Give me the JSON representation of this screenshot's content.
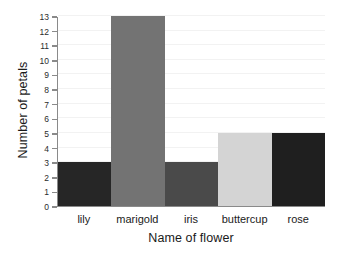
{
  "chart_data": {
    "type": "bar",
    "title": "",
    "subtitle": "",
    "xlabel": "Name of flower",
    "ylabel": "Number of petals",
    "categories": [
      "lily",
      "marigold",
      "iris",
      "buttercup",
      "rose"
    ],
    "values": [
      3,
      13,
      3,
      5,
      5
    ],
    "bar_colors": [
      "#262626",
      "#737373",
      "#4a4a4a",
      "#d4d4d4",
      "#1f1f1f"
    ],
    "ylim": [
      0,
      13
    ],
    "ytick_labels": [
      "0",
      "1",
      "2",
      "3",
      "4",
      "5",
      "6",
      "7",
      "8",
      "9",
      "10",
      "11",
      "12",
      "13"
    ],
    "ytick_values": [
      0,
      1,
      2,
      3,
      4,
      5,
      6,
      7,
      8,
      9,
      10,
      11,
      12,
      13
    ],
    "grid": true,
    "legend": "none",
    "background_color": "#ffffff",
    "axis_color": "#8a8a8a",
    "grid_color": "#f2f2f2",
    "text_color": "#1a1a1a"
  }
}
